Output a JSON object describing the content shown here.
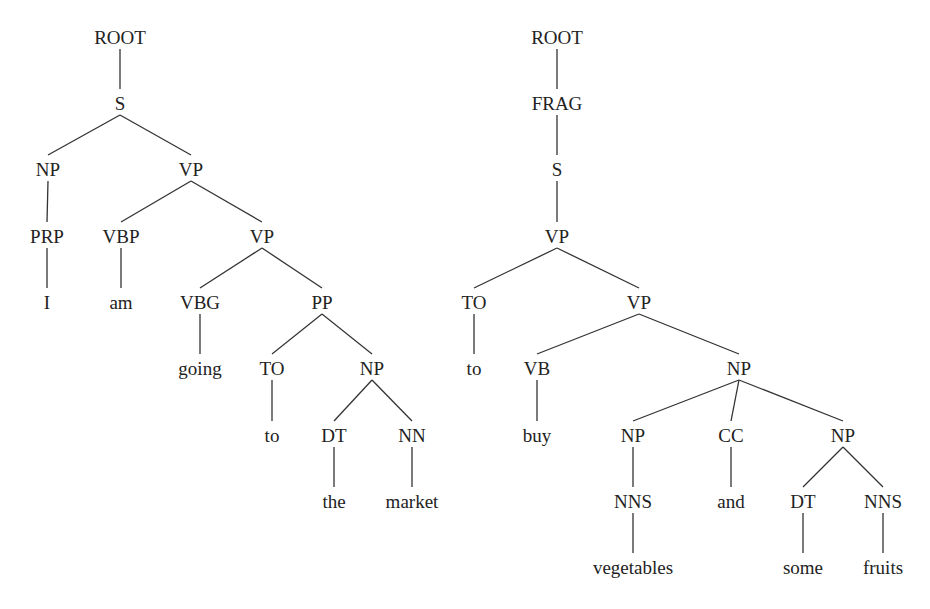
{
  "trees": [
    {
      "id": "tree-1",
      "sentence": "I am going to the market",
      "nodes": [
        {
          "id": "l0",
          "label": "ROOT",
          "x": 120,
          "y": 37,
          "parent": null
        },
        {
          "id": "l1",
          "label": "S",
          "x": 120,
          "y": 103,
          "parent": "l0"
        },
        {
          "id": "l2",
          "label": "NP",
          "x": 48,
          "y": 169,
          "parent": "l1"
        },
        {
          "id": "l3",
          "label": "VP",
          "x": 191,
          "y": 169,
          "parent": "l1"
        },
        {
          "id": "l4",
          "label": "PRP",
          "x": 47,
          "y": 236,
          "parent": "l2"
        },
        {
          "id": "l5",
          "label": "VBP",
          "x": 121,
          "y": 236,
          "parent": "l3"
        },
        {
          "id": "l6",
          "label": "VP",
          "x": 262,
          "y": 236,
          "parent": "l3"
        },
        {
          "id": "l7",
          "label": "I",
          "x": 47,
          "y": 302,
          "parent": "l4"
        },
        {
          "id": "l8",
          "label": "am",
          "x": 121,
          "y": 302,
          "parent": "l5"
        },
        {
          "id": "l9",
          "label": "VBG",
          "x": 200,
          "y": 302,
          "parent": "l6"
        },
        {
          "id": "l10",
          "label": "PP",
          "x": 322,
          "y": 302,
          "parent": "l6"
        },
        {
          "id": "l11",
          "label": "going",
          "x": 200,
          "y": 368,
          "parent": "l9"
        },
        {
          "id": "l12",
          "label": "TO",
          "x": 272,
          "y": 368,
          "parent": "l10"
        },
        {
          "id": "l13",
          "label": "NP",
          "x": 372,
          "y": 368,
          "parent": "l10"
        },
        {
          "id": "l14",
          "label": "to",
          "x": 272,
          "y": 435,
          "parent": "l12"
        },
        {
          "id": "l15",
          "label": "DT",
          "x": 334,
          "y": 435,
          "parent": "l13"
        },
        {
          "id": "l16",
          "label": "NN",
          "x": 412,
          "y": 435,
          "parent": "l13"
        },
        {
          "id": "l17",
          "label": "the",
          "x": 334,
          "y": 501,
          "parent": "l15"
        },
        {
          "id": "l18",
          "label": "market",
          "x": 412,
          "y": 501,
          "parent": "l16"
        }
      ]
    },
    {
      "id": "tree-2",
      "sentence": "to buy vegetables and some fruits",
      "nodes": [
        {
          "id": "r0",
          "label": "ROOT",
          "x": 557,
          "y": 37,
          "parent": null
        },
        {
          "id": "r1",
          "label": "FRAG",
          "x": 557,
          "y": 103,
          "parent": "r0"
        },
        {
          "id": "r2",
          "label": "S",
          "x": 557,
          "y": 169,
          "parent": "r1"
        },
        {
          "id": "r3",
          "label": "VP",
          "x": 557,
          "y": 236,
          "parent": "r2"
        },
        {
          "id": "r4",
          "label": "TO",
          "x": 474,
          "y": 302,
          "parent": "r3"
        },
        {
          "id": "r5",
          "label": "VP",
          "x": 639,
          "y": 302,
          "parent": "r3"
        },
        {
          "id": "r6",
          "label": "to",
          "x": 474,
          "y": 368,
          "parent": "r4"
        },
        {
          "id": "r7",
          "label": "VB",
          "x": 537,
          "y": 368,
          "parent": "r5"
        },
        {
          "id": "r8",
          "label": "NP",
          "x": 739,
          "y": 368,
          "parent": "r5"
        },
        {
          "id": "r9",
          "label": "buy",
          "x": 537,
          "y": 435,
          "parent": "r7"
        },
        {
          "id": "r10",
          "label": "NP",
          "x": 633,
          "y": 435,
          "parent": "r8"
        },
        {
          "id": "r11",
          "label": "CC",
          "x": 731,
          "y": 435,
          "parent": "r8"
        },
        {
          "id": "r12",
          "label": "NP",
          "x": 843,
          "y": 435,
          "parent": "r8"
        },
        {
          "id": "r13",
          "label": "NNS",
          "x": 633,
          "y": 501,
          "parent": "r10"
        },
        {
          "id": "r14",
          "label": "and",
          "x": 731,
          "y": 501,
          "parent": "r11"
        },
        {
          "id": "r15",
          "label": "DT",
          "x": 803,
          "y": 501,
          "parent": "r12"
        },
        {
          "id": "r16",
          "label": "NNS",
          "x": 883,
          "y": 501,
          "parent": "r12"
        },
        {
          "id": "r17",
          "label": "vegetables",
          "x": 633,
          "y": 567,
          "parent": "r13"
        },
        {
          "id": "r18",
          "label": "some",
          "x": 803,
          "y": 567,
          "parent": "r15"
        },
        {
          "id": "r19",
          "label": "fruits",
          "x": 883,
          "y": 567,
          "parent": "r16"
        }
      ]
    }
  ],
  "style": {
    "text_color": "#222222",
    "edge_color": "#333333",
    "background": "#ffffff"
  }
}
